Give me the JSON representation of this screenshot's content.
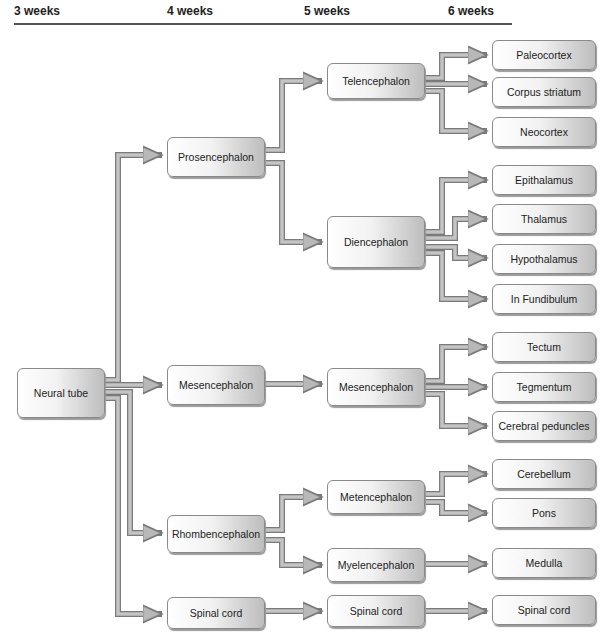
{
  "headers": [
    "3 weeks",
    "4 weeks",
    "5 weeks",
    "6 weeks"
  ],
  "nodes": {
    "neural_tube": "Neural tube",
    "prosencephalon": "Prosencephalon",
    "mesencephalon_4": "Mesencephalon",
    "rhombencephalon": "Rhombencephalon",
    "spinal_cord_4": "Spinal cord",
    "telencephalon": "Telencephalon",
    "diencephalon": "Diencephalon",
    "mesencephalon_5": "Mesencephalon",
    "metencephalon": "Metencephalon",
    "myelencephalon": "Myelencephalon",
    "spinal_cord_5": "Spinal cord",
    "paleocortex": "Paleocortex",
    "corpus_striatum": "Corpus striatum",
    "neocortex": "Neocortex",
    "epithalamus": "Epithalamus",
    "thalamus": "Thalamus",
    "hypothalamus": "Hypothalamus",
    "infundibulum": "In Fundibulum",
    "tectum": "Tectum",
    "tegmentum": "Tegmentum",
    "cerebral_peduncles": "Cerebral peduncles",
    "cerebellum": "Cerebellum",
    "pons": "Pons",
    "medulla": "Medulla",
    "spinal_cord_6": "Spinal cord"
  },
  "colors": {
    "arrow_fill": "#b8b8b8",
    "arrow_edge": "#7a7a7a",
    "box_border": "#8a8a8a",
    "rule": "#555555"
  }
}
